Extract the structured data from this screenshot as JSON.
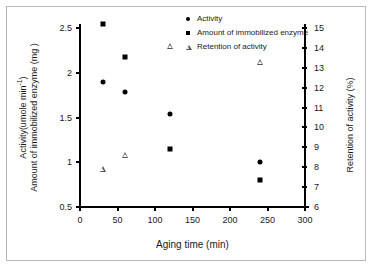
{
  "chart_data": {
    "type": "scatter",
    "title": "",
    "xlabel": "Aging time (min)",
    "ylabel_left_line1": "Activity(umole min",
    "ylabel_left_sup": "-1",
    "ylabel_left_line1_end": ")",
    "ylabel_left_line2": "Amount of immobilized enzyme",
    "ylabel_left_line3": "(mg )",
    "ylabel_right": "Retention of activity (%)",
    "x": [
      30,
      60,
      120,
      240
    ],
    "xlim": [
      0,
      300
    ],
    "xticks": [
      0,
      50,
      100,
      150,
      200,
      250,
      300
    ],
    "ylim_left": [
      0.5,
      2.5
    ],
    "yticks_left": [
      0.5,
      1,
      1.5,
      2,
      2.5
    ],
    "ylim_right": [
      6,
      15
    ],
    "yticks_right": [
      6,
      7,
      8,
      9,
      10,
      11,
      12,
      13,
      14,
      15
    ],
    "grid": false,
    "legend_position": "top-right",
    "series": [
      {
        "name": "Activity",
        "marker": "filled-circle",
        "axis": "left",
        "color": "#000000",
        "values": [
          1.9,
          1.79,
          1.54,
          1.0
        ]
      },
      {
        "name": "Amount of  immobilized enzyme",
        "marker": "filled-square",
        "axis": "left",
        "color": "#000000",
        "values": [
          2.55,
          2.18,
          1.15,
          0.8
        ]
      },
      {
        "name": "Retention of  activity",
        "marker": "open-triangle",
        "axis": "right",
        "color": "#555555",
        "values": [
          7.9,
          8.6,
          14.1,
          13.3
        ]
      }
    ]
  },
  "legend": {
    "items": [
      {
        "label": "Activity",
        "key": "filled-circle-marker"
      },
      {
        "label": "Amount of  immobilized enzyme",
        "key": "filled-square-marker"
      },
      {
        "label": "Retention of  activity",
        "key": "open-triangle-marker"
      }
    ]
  },
  "axes": {
    "x_tick_labels": [
      "0",
      "50",
      "100",
      "150",
      "200",
      "250",
      "300"
    ],
    "y_left_tick_labels": [
      "2.5",
      "2",
      "1.5",
      "1",
      "0.5"
    ],
    "y_right_tick_labels": [
      "15",
      "14",
      "13",
      "12",
      "11",
      "10",
      "9",
      "8",
      "7",
      "6"
    ],
    "x_title": "Aging time (min)",
    "y_left_title_line1": "Activity(umole min",
    "y_left_title_sup": "-1",
    "y_left_title_line1_tail": ")",
    "y_left_title_line2": "Amount of immobilized enzyme",
    "y_left_title_line3": "(mg )",
    "y_right_title": "Retention of activity (%)"
  }
}
